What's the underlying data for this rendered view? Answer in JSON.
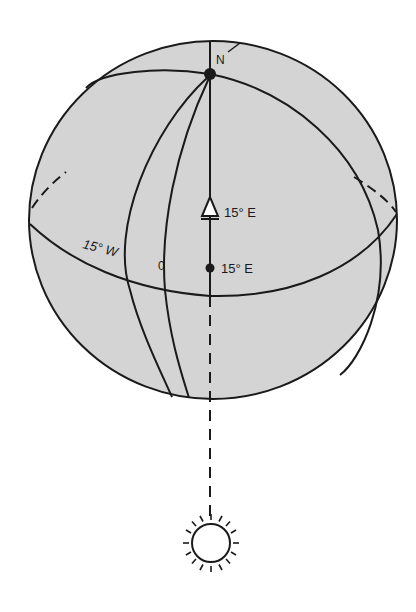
{
  "diagram": {
    "colors": {
      "globe_fill": "#d4d4d4",
      "stroke": "#1a1a1a",
      "background": "#ffffff",
      "marker_fill": "#ffffff"
    },
    "labels": {
      "north_pole": "N",
      "meridian_west": "15° W",
      "meridian_zero": "0",
      "marker_triangle": "15° E",
      "marker_dot": "15° E"
    },
    "elements": {
      "globe": "sphere",
      "pole": "north-pole-dot",
      "equator": "equator-line",
      "meridians": [
        "15° W",
        "0",
        "15° E"
      ],
      "sun": "sun-icon",
      "sun_ray": "dashed-line-to-sun"
    }
  }
}
